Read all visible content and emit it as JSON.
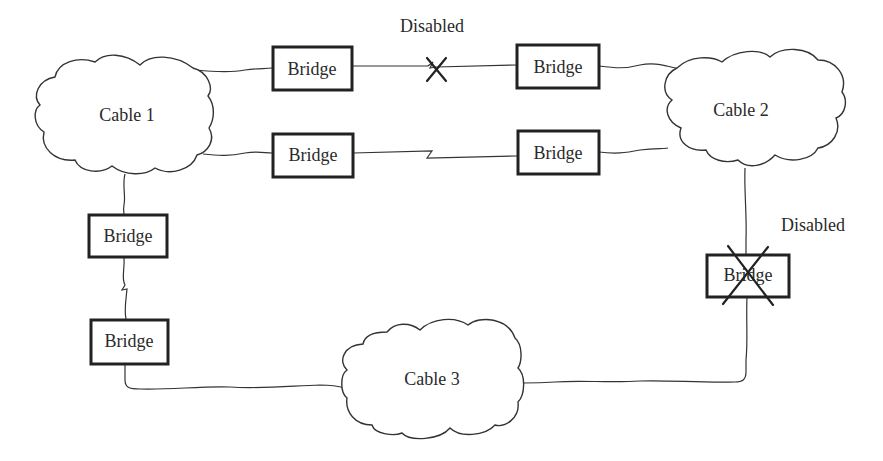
{
  "diagram": {
    "type": "network-topology",
    "clouds": [
      {
        "id": "cable1",
        "label": "Cable 1"
      },
      {
        "id": "cable2",
        "label": "Cable 2"
      },
      {
        "id": "cable3",
        "label": "Cable 3"
      }
    ],
    "bridges": [
      {
        "id": "bridge-top-left",
        "label": "Bridge",
        "link": "cable1-cable2 (top)",
        "state": "link disabled"
      },
      {
        "id": "bridge-top-right",
        "label": "Bridge",
        "link": "cable1-cable2 (top)",
        "state": "link disabled"
      },
      {
        "id": "bridge-mid-left",
        "label": "Bridge",
        "link": "cable1-cable2 (remote)",
        "state": "active"
      },
      {
        "id": "bridge-mid-right",
        "label": "Bridge",
        "link": "cable1-cable2 (remote)",
        "state": "active"
      },
      {
        "id": "bridge-left-upper",
        "label": "Bridge",
        "link": "cable1-cable3 (remote)",
        "state": "active"
      },
      {
        "id": "bridge-left-lower",
        "label": "Bridge",
        "link": "cable1-cable3 (remote)",
        "state": "active"
      },
      {
        "id": "bridge-right",
        "label": "Bridge",
        "link": "cable2-cable3",
        "state": "disabled"
      }
    ],
    "annotations": [
      {
        "id": "disabled-top",
        "label": "Disabled"
      },
      {
        "id": "disabled-right",
        "label": "Disabled"
      }
    ]
  }
}
